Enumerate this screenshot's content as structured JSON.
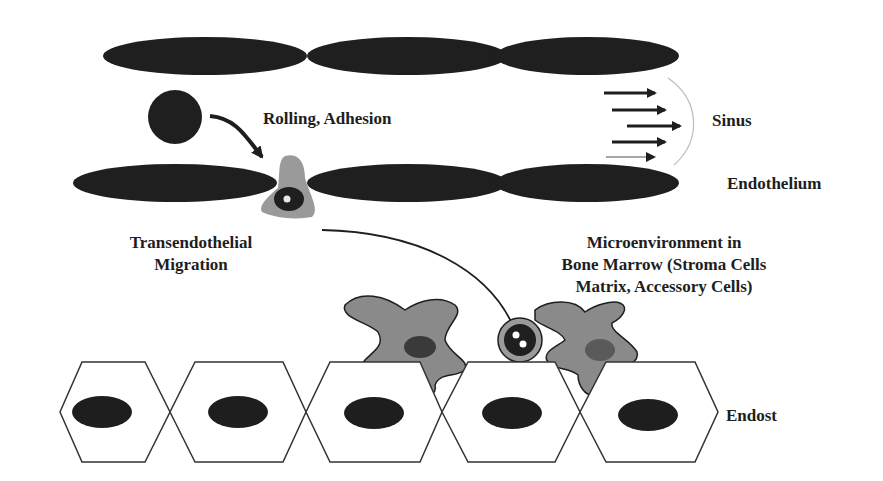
{
  "diagram": {
    "labels": {
      "rolling_adhesion": "Rolling, Adhesion",
      "sinus": "Sinus",
      "endothelium": "Endothelium",
      "transendothelial_line1": "Transendothelial",
      "transendothelial_line2": "Migration",
      "micro_line1": "Microenvironment in",
      "micro_line2": "Bone Marrow (Stroma Cells",
      "micro_line3": "Matrix, Accessory Cells)",
      "endost": "Endost"
    },
    "colors": {
      "endothelial_cell": "#1f1f1f",
      "migrating_cell_cytoplasm": "#9a9a9a",
      "stroma_cell": "#8a8a8a",
      "stroma_nucleus": "#3a3a3a",
      "osteoblast_outline": "#333333",
      "osteoblast_nucleus": "#1e1e1e",
      "background": "#ffffff"
    },
    "nodes": [
      {
        "id": "circulating-cell",
        "label": "circulating cell"
      },
      {
        "id": "migrating-cell",
        "label": "cell crossing endothelium"
      },
      {
        "id": "homed-cell",
        "label": "cell in niche"
      },
      {
        "id": "stroma-cell-left",
        "label": "stroma cell"
      },
      {
        "id": "stroma-cell-right",
        "label": "stroma cell"
      },
      {
        "id": "endost-cells",
        "label": "endosteal lining cells",
        "count": 5
      }
    ],
    "edges": [
      {
        "from": "circulating-cell",
        "to": "migrating-cell",
        "label": "Rolling, Adhesion"
      },
      {
        "from": "migrating-cell",
        "to": "homed-cell",
        "label": "Transendothelial Migration"
      }
    ],
    "flow_arrows_count": 5
  }
}
